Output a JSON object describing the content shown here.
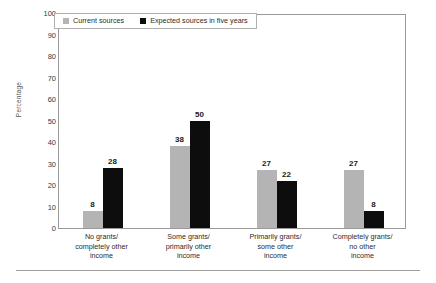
{
  "chart_data": {
    "type": "bar",
    "title": "",
    "subtitle": "",
    "xlabel": "",
    "ylabel": "Percentage",
    "ylim": [
      0,
      100
    ],
    "ytick_step": 10,
    "yticks": [
      0,
      10,
      20,
      30,
      40,
      50,
      60,
      70,
      80,
      90,
      100
    ],
    "grid": false,
    "legend_position": "top-left-inside",
    "categories": [
      "No grants/\ncompletely other\nincome",
      "Some grants/\nprimarily other\nincome",
      "Primarily grants/\nsome other\nincome",
      "Completely grants/\nno other\nincome"
    ],
    "category_lines": [
      [
        "No grants/",
        "completely other",
        "income"
      ],
      [
        "Some grants/",
        "primarily other",
        "income"
      ],
      [
        "Primarily grants/",
        "some other",
        "income"
      ],
      [
        "Completely grants/",
        "no other",
        "income"
      ]
    ],
    "series": [
      {
        "name": "Current sources",
        "color": "#b4b4b4",
        "values": [
          8,
          38,
          27,
          27
        ]
      },
      {
        "name": "Expected sources in five years",
        "color": "#0d0d0d",
        "values": [
          28,
          50,
          22,
          8
        ]
      }
    ]
  },
  "axis": {
    "y_title": "Percentage",
    "y_tick_labels": [
      "100",
      "90",
      "80",
      "70",
      "60",
      "50",
      "40",
      "30",
      "20",
      "10",
      "0"
    ]
  },
  "legend": {
    "items": [
      {
        "label": "Current sources",
        "color": "#b4b4b4"
      },
      {
        "label": "Expected sources in five years",
        "color": "#0d0d0d"
      }
    ]
  },
  "colors": {
    "current_series": "#b4b4b4",
    "expected_series": "#0d0d0d",
    "frame": "#9a9a9a",
    "background": "#ffffff",
    "text": "#2b2b2b"
  }
}
